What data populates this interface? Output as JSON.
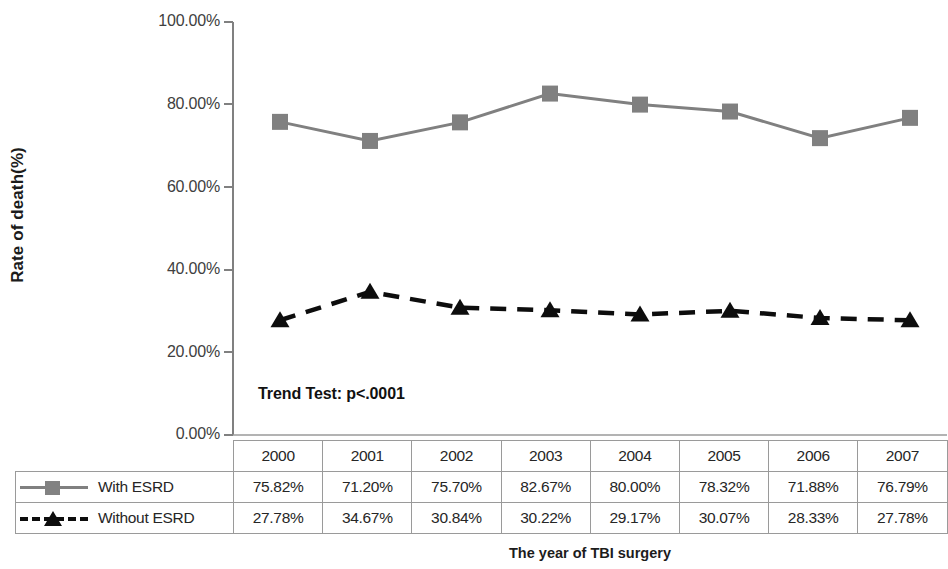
{
  "chart_data": {
    "type": "line",
    "title": "",
    "xlabel": "The year of TBI surgery",
    "ylabel": "Rate of death(%)",
    "categories": [
      "2000",
      "2001",
      "2002",
      "2003",
      "2004",
      "2005",
      "2006",
      "2007"
    ],
    "series": [
      {
        "name": "With ESRD",
        "values": [
          75.82,
          71.2,
          75.7,
          82.67,
          80.0,
          78.32,
          71.88,
          76.79
        ],
        "labels": [
          "75.82%",
          "71.20%",
          "75.70%",
          "82.67%",
          "80.00%",
          "78.32%",
          "71.88%",
          "76.79%"
        ],
        "marker": "square",
        "line_style": "solid",
        "color": "#808080"
      },
      {
        "name": "Without ESRD",
        "values": [
          27.78,
          34.67,
          30.84,
          30.22,
          29.17,
          30.07,
          28.33,
          27.78
        ],
        "labels": [
          "27.78%",
          "34.67%",
          "30.84%",
          "30.22%",
          "29.17%",
          "30.07%",
          "28.33%",
          "27.78%"
        ],
        "marker": "triangle",
        "line_style": "dashed",
        "color": "#0d0d0d"
      }
    ],
    "ylim": [
      0,
      100
    ],
    "yticks": [
      0,
      20,
      40,
      60,
      80,
      100
    ],
    "ytick_labels": [
      "0.00%",
      "20.00%",
      "40.00%",
      "60.00%",
      "80.00%",
      "100.00%"
    ],
    "grid": false,
    "legend_position": "data-table-left",
    "annotations": [
      {
        "text": "Trend Test: p<.0001",
        "x": 2000,
        "y": 12
      }
    ]
  },
  "axis": {
    "y_title": "Rate of death(%)",
    "x_title": "The year of TBI surgery",
    "ticks": [
      {
        "label": "100.00%",
        "value": 100
      },
      {
        "label": "80.00%",
        "value": 80
      },
      {
        "label": "60.00%",
        "value": 60
      },
      {
        "label": "40.00%",
        "value": 40
      },
      {
        "label": "20.00%",
        "value": 20
      },
      {
        "label": "0.00%",
        "value": 0
      }
    ]
  },
  "annotation": {
    "trend_test": "Trend Test: p<.0001"
  },
  "table": {
    "years": [
      "2000",
      "2001",
      "2002",
      "2003",
      "2004",
      "2005",
      "2006",
      "2007"
    ],
    "rows": [
      {
        "label": "With ESRD",
        "values": [
          "75.82%",
          "71.20%",
          "75.70%",
          "82.67%",
          "80.00%",
          "78.32%",
          "71.88%",
          "76.79%"
        ]
      },
      {
        "label": "Without ESRD",
        "values": [
          "27.78%",
          "34.67%",
          "30.84%",
          "30.22%",
          "29.17%",
          "30.07%",
          "28.33%",
          "27.78%"
        ]
      }
    ]
  },
  "colors": {
    "series_with_esrd": "#808080",
    "series_without_esrd": "#0d0d0d",
    "axis": "#808080",
    "grid_border": "#9a9a9a"
  }
}
